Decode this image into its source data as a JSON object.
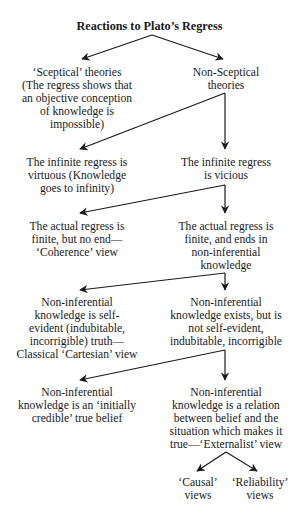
{
  "title": "Reactions to Plato’s Regress",
  "nodes": {
    "sceptical": "‘Sceptical’ theories\n(The regress shows that\nan objective conception\nof knowledge is\nimpossible)",
    "non_sceptical": "Non-Sceptical\ntheories",
    "infinite_virtuous": "The infinite regress is\nvirtuous (Knowledge\ngoes to infinity)",
    "infinite_vicious": "The infinite regress\nis vicious",
    "coherence": "The actual regress is\nfinite, but no end—\n‘Coherence’ view",
    "ends_noninferential": "The actual regress is\nfinite, and ends in\nnon-inferential\nknowledge",
    "cartesian": "Non-inferential\nknowledge is self-\nevident (indubitable,\nincorrigible) truth—\nClassical ‘Cartesian’ view",
    "not_self_evident": "Non-inferential\nknowledge exists, but is\nnot self-evident,\nindubitable, incorrigible",
    "initially_credible": "Non-inferential\nknowledge is an ‘initially\ncredible’ true belief",
    "externalist": "Non-inferential\nknowledge is a relation\nbetween belief and the\nsituation which makes it\ntrue—‘Externalist’ view",
    "causal": "‘Causal’\nviews",
    "reliability": "‘Reliability’\nviews"
  },
  "colors": {
    "text": "#1a1a1a",
    "arrow": "#1a1a1a",
    "background": "#ffffff"
  }
}
